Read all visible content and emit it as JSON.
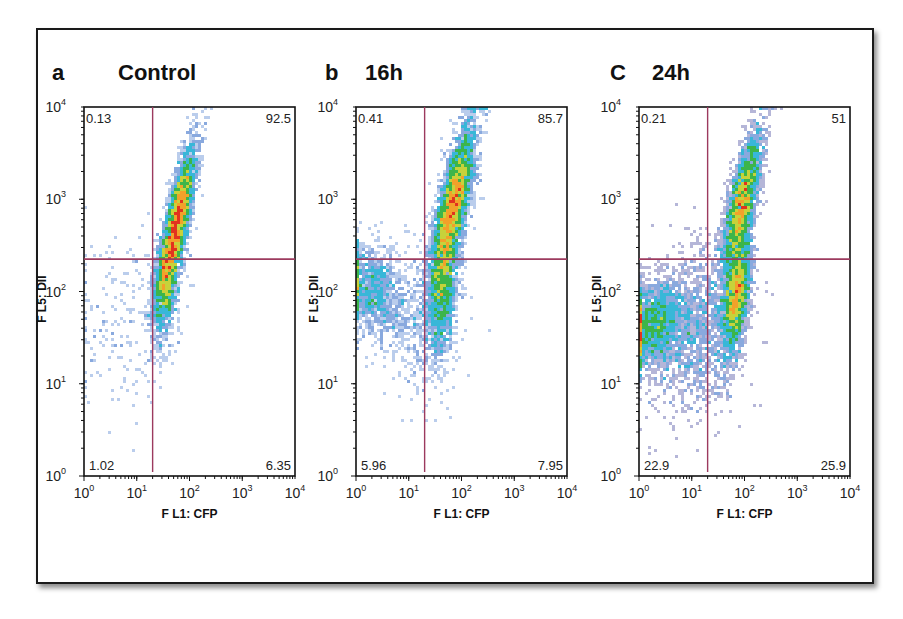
{
  "chart_data": [
    {
      "type": "scatter",
      "subtype": "flow-cytometry-density-plot",
      "panel_letter": "a",
      "title": "Control",
      "xlabel": "F L1: CFP",
      "ylabel": "F L5: DII",
      "xscale": "log",
      "yscale": "log",
      "xlim": [
        1,
        10000
      ],
      "ylim": [
        1,
        10000
      ],
      "x_ticks": [
        {
          "base": "10",
          "exp": "0"
        },
        {
          "base": "10",
          "exp": "1"
        },
        {
          "base": "10",
          "exp": "2"
        },
        {
          "base": "10",
          "exp": "3"
        },
        {
          "base": "10",
          "exp": "4"
        }
      ],
      "y_ticks": [
        {
          "base": "10",
          "exp": "0"
        },
        {
          "base": "10",
          "exp": "1"
        },
        {
          "base": "10",
          "exp": "2"
        },
        {
          "base": "10",
          "exp": "3"
        },
        {
          "base": "10",
          "exp": "4"
        }
      ],
      "gates": {
        "x": 20,
        "y": 224
      },
      "quadrants": {
        "upper_left": "0.13",
        "upper_right": "92.5",
        "lower_left": "1.02",
        "lower_right": "6.35"
      },
      "populations": [
        {
          "center_log": [
            1.75,
            2.7
          ],
          "spread_log": [
            0.18,
            0.42
          ],
          "corr": 0.8,
          "n": 1400,
          "label": "main"
        },
        {
          "center_log": [
            1.55,
            2.05
          ],
          "spread_log": [
            0.12,
            0.3
          ],
          "corr": 0.3,
          "n": 300,
          "label": "tail"
        },
        {
          "center_log": [
            0.6,
            1.7
          ],
          "spread_log": [
            0.5,
            0.5
          ],
          "corr": 0,
          "n": 60,
          "label": "background"
        }
      ]
    },
    {
      "type": "scatter",
      "subtype": "flow-cytometry-density-plot",
      "panel_letter": "b",
      "title": "16h",
      "xlabel": "F L1: CFP",
      "ylabel": "F L5: DII",
      "xscale": "log",
      "yscale": "log",
      "xlim": [
        1,
        10000
      ],
      "ylim": [
        1,
        10000
      ],
      "x_ticks": [
        {
          "base": "10",
          "exp": "0"
        },
        {
          "base": "10",
          "exp": "1"
        },
        {
          "base": "10",
          "exp": "2"
        },
        {
          "base": "10",
          "exp": "3"
        },
        {
          "base": "10",
          "exp": "4"
        }
      ],
      "y_ticks": [
        {
          "base": "10",
          "exp": "0"
        },
        {
          "base": "10",
          "exp": "1"
        },
        {
          "base": "10",
          "exp": "2"
        },
        {
          "base": "10",
          "exp": "3"
        },
        {
          "base": "10",
          "exp": "4"
        }
      ],
      "gates": {
        "x": 20,
        "y": 224
      },
      "quadrants": {
        "upper_left": "0.41",
        "upper_right": "85.7",
        "lower_left": "5.96",
        "lower_right": "7.95"
      },
      "populations": [
        {
          "center_log": [
            1.85,
            2.95
          ],
          "spread_log": [
            0.2,
            0.42
          ],
          "corr": 0.75,
          "n": 1500,
          "label": "main"
        },
        {
          "center_log": [
            1.65,
            2.05
          ],
          "spread_log": [
            0.15,
            0.38
          ],
          "corr": 0.4,
          "n": 600,
          "label": "tail"
        },
        {
          "center_log": [
            0.3,
            2.0
          ],
          "spread_log": [
            0.3,
            0.25
          ],
          "corr": -0.2,
          "n": 400,
          "label": "left"
        },
        {
          "center_log": [
            1.2,
            1.7
          ],
          "spread_log": [
            0.4,
            0.4
          ],
          "corr": 0,
          "n": 150,
          "label": "background"
        }
      ]
    },
    {
      "type": "scatter",
      "subtype": "flow-cytometry-density-plot",
      "panel_letter": "C",
      "title": "24h",
      "xlabel": "F L1: CFP",
      "ylabel": "F L5: DII",
      "xscale": "log",
      "yscale": "log",
      "xlim": [
        1,
        10000
      ],
      "ylim": [
        1,
        10000
      ],
      "x_ticks": [
        {
          "base": "10",
          "exp": "0"
        },
        {
          "base": "10",
          "exp": "1"
        },
        {
          "base": "10",
          "exp": "2"
        },
        {
          "base": "10",
          "exp": "3"
        },
        {
          "base": "10",
          "exp": "4"
        }
      ],
      "y_ticks": [
        {
          "base": "10",
          "exp": "0"
        },
        {
          "base": "10",
          "exp": "1"
        },
        {
          "base": "10",
          "exp": "2"
        },
        {
          "base": "10",
          "exp": "3"
        },
        {
          "base": "10",
          "exp": "4"
        }
      ],
      "gates": {
        "x": 20,
        "y": 224
      },
      "quadrants": {
        "upper_left": "0.21",
        "upper_right": "51",
        "lower_left": "22.9",
        "lower_right": "25.9"
      },
      "populations": [
        {
          "center_log": [
            1.95,
            2.95
          ],
          "spread_log": [
            0.18,
            0.38
          ],
          "corr": 0.75,
          "n": 1100,
          "label": "upper"
        },
        {
          "center_log": [
            1.85,
            1.95
          ],
          "spread_log": [
            0.13,
            0.32
          ],
          "corr": 0.5,
          "n": 900,
          "label": "middle"
        },
        {
          "center_log": [
            0.25,
            1.65
          ],
          "spread_log": [
            0.3,
            0.22
          ],
          "corr": 0.3,
          "n": 700,
          "label": "left"
        },
        {
          "center_log": [
            1.1,
            1.6
          ],
          "spread_log": [
            0.45,
            0.45
          ],
          "corr": 0.2,
          "n": 500,
          "label": "bridge"
        }
      ]
    }
  ],
  "colors": {
    "gate_line": "#9c3a5e",
    "density_scale": [
      "#2a2f8f",
      "#3a6fc8",
      "#38b7d8",
      "#3cb54a",
      "#c7d23a",
      "#f2a12a",
      "#e2321f"
    ]
  }
}
